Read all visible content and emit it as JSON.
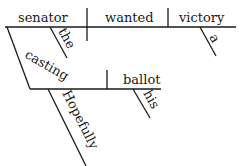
{
  "diagram": {
    "type": "sentence-diagram",
    "style": "Reed-Kellogg",
    "main_clause": {
      "subject": "senator",
      "verb": "wanted",
      "direct_object": "victory",
      "subject_modifiers": [
        "the"
      ],
      "object_modifiers": [
        "a"
      ]
    },
    "participial_phrase": {
      "participle": "casting",
      "object": "ballot",
      "object_modifiers": [
        "his"
      ],
      "adverb_modifiers": [
        "Hopefully"
      ]
    }
  },
  "words": {
    "senator": "senator",
    "wanted": "wanted",
    "victory": "victory",
    "the": "the",
    "a": "a",
    "casting": "casting",
    "ballot": "ballot",
    "his": "his",
    "hopefully": "Hopefully"
  },
  "colors": {
    "ink": "#1a1a1a",
    "background": "#ffffff"
  }
}
